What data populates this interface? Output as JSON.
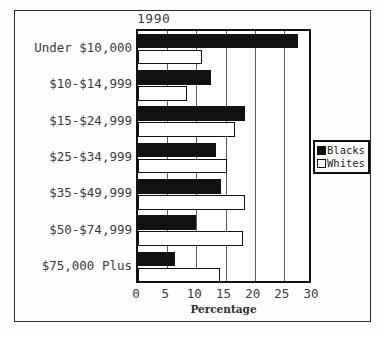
{
  "chart_data": {
    "type": "bar",
    "orientation": "horizontal",
    "title": "1990",
    "xlabel": "Percentage",
    "ylabel": "",
    "xlim": [
      0,
      30
    ],
    "xticks": [
      0,
      5,
      10,
      15,
      20,
      25,
      30
    ],
    "grid": true,
    "legend_position": "right",
    "categories": [
      "Under $10,000",
      "$10-$14,999",
      "$15-$24,999",
      "$25-$34,999",
      "$35-$49,999",
      "$50-$74,999",
      "$75,000 Plus"
    ],
    "series": [
      {
        "name": "Blacks",
        "color": "#111111",
        "values": [
          27.4,
          12.5,
          18.4,
          13.4,
          14.3,
          10.0,
          6.3
        ]
      },
      {
        "name": "Whites",
        "color": "#ffffff",
        "values": [
          10.9,
          8.4,
          16.7,
          15.2,
          18.4,
          18.0,
          14.1
        ]
      }
    ]
  },
  "legend": {
    "items": [
      {
        "label": "Blacks",
        "swatch": "filled-black-swatch"
      },
      {
        "label": "Whites",
        "swatch": "outlined-white-swatch"
      }
    ]
  }
}
